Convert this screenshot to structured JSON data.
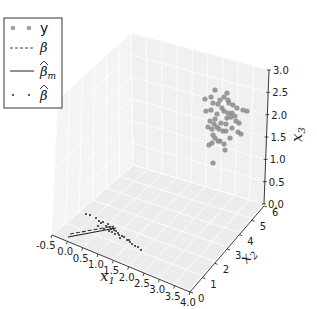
{
  "chart_data": {
    "type": "scatter3d",
    "title": "",
    "axes": {
      "x": {
        "label": "x1",
        "ticks": [
          "-0.5",
          "0.0",
          "0.5",
          "1.0",
          "1.5",
          "2.0",
          "2.5",
          "3.0",
          "3.5",
          "4.0"
        ],
        "range": [
          -0.5,
          4.0
        ]
      },
      "y": {
        "label": "x2",
        "ticks": [
          "0",
          "1",
          "2",
          "3",
          "4",
          "5",
          "6"
        ],
        "range": [
          0,
          6
        ]
      },
      "z": {
        "label": "x3",
        "ticks": [
          "0.0",
          "0.5",
          "1.0",
          "1.5",
          "2.0",
          "2.5",
          "3.0"
        ],
        "range": [
          0,
          3.0
        ]
      }
    },
    "grid": true,
    "legend": {
      "position": "upper left",
      "entries": [
        {
          "label": "y",
          "marker": "large gray dots",
          "color": "#8c8c8c"
        },
        {
          "label": "β",
          "marker": "dashed line",
          "color": "#333333"
        },
        {
          "label": "β̂_m",
          "marker": "solid line",
          "color": "#222222"
        },
        {
          "label": "β̂",
          "marker": "small dark dots",
          "color": "#222222"
        }
      ]
    },
    "series": [
      {
        "name": "y",
        "type": "scatter",
        "description": "cluster of ~50 gray points near x1≈3.8, x2≈5.5, x3≈1.5–2.6"
      },
      {
        "name": "β",
        "type": "dashed line",
        "description": "short dashed segment near floor from x1≈0 to x1≈1.5"
      },
      {
        "name": "β̂_m",
        "type": "solid line",
        "description": "short solid segment near floor from x1≈0 to x1≈1.5"
      },
      {
        "name": "β̂",
        "type": "scatter",
        "description": "small dark points along diagonal near floor, x1≈0.5–3.0"
      }
    ]
  },
  "labels": {
    "x_label": "x",
    "x_sub": "1",
    "y_label": "x",
    "y_sub": "2",
    "z_label": "x",
    "z_sub": "3",
    "x_ticks": [
      "-0.5",
      "0.0",
      "0.5",
      "1.0",
      "1.5",
      "2.0",
      "2.5",
      "3.0",
      "3.5",
      "4.0"
    ],
    "y_ticks": [
      "0",
      "1",
      "2",
      "3",
      "4",
      "5",
      "6"
    ],
    "z_ticks": [
      "0.0",
      "0.5",
      "1.0",
      "1.5",
      "2.0",
      "2.5",
      "3.0"
    ],
    "legend_y": "y",
    "legend_beta": "β",
    "legend_beta_hat_m": "β",
    "legend_beta_hat_m_sub": "m",
    "legend_beta_hat": "β",
    "hat": "^"
  }
}
